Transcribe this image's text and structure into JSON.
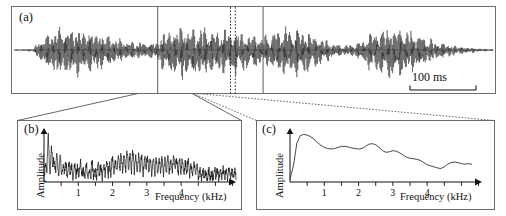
{
  "figure": {
    "panels": [
      {
        "id": "a",
        "label": "(a)",
        "type": "waveform",
        "scalebar": {
          "label": "100 ms"
        }
      },
      {
        "id": "b",
        "label": "(b)",
        "type": "spectrum",
        "ylabel": "Amplitude",
        "xlabel": "Frequency (kHz)",
        "ticks": [
          "1",
          "2",
          "3",
          "4"
        ]
      },
      {
        "id": "c",
        "label": "(c)",
        "type": "spectrum",
        "ylabel": "Amplitude",
        "xlabel": "Frequency (kHz)",
        "ticks": [
          "1",
          "2",
          "3",
          "4"
        ]
      }
    ]
  },
  "chart_data": [
    {
      "type": "line",
      "panel": "a",
      "title": "",
      "xlabel": "",
      "ylabel": "",
      "xlim": [
        0,
        1000
      ],
      "ylim": [
        -1,
        1
      ],
      "grid": false,
      "legend": null,
      "annotations": [
        {
          "text": "(a)",
          "x": 8,
          "y": 0.9
        },
        {
          "text": "100 ms",
          "x": 830,
          "y": -0.72
        }
      ],
      "scalebar_ms": 100,
      "description": "Amplitude-modulated acoustic waveform (oscillogram) with four successive tone bursts; vertical solid cursors at 300 and 520 ms and a narrow dotted cursor pair at 455-462 ms mark the analysis windows expanded in panels (b) and (c).",
      "markers": {
        "solid_lines_ms": [
          300,
          520
        ],
        "dotted_lines_ms": [
          452,
          462
        ]
      },
      "envelope": {
        "x": [
          0,
          20,
          40,
          55,
          70,
          85,
          100,
          115,
          130,
          145,
          160,
          175,
          190,
          205,
          220,
          235,
          250,
          265,
          280,
          295,
          300,
          310,
          325,
          340,
          355,
          370,
          385,
          400,
          415,
          430,
          445,
          455,
          462,
          470,
          485,
          500,
          515,
          520,
          530,
          545,
          560,
          575,
          590,
          605,
          620,
          635,
          650,
          665,
          680,
          695,
          710,
          725,
          740,
          755,
          770,
          785,
          800,
          815,
          830,
          845,
          860,
          875,
          890,
          905,
          920,
          935,
          950,
          965,
          980,
          1000
        ],
        "y": [
          0.02,
          0.03,
          0.05,
          0.35,
          0.62,
          0.74,
          0.8,
          0.82,
          0.8,
          0.76,
          0.7,
          0.64,
          0.56,
          0.47,
          0.4,
          0.34,
          0.3,
          0.28,
          0.27,
          0.28,
          0.3,
          0.62,
          0.78,
          0.84,
          0.86,
          0.85,
          0.83,
          0.8,
          0.78,
          0.76,
          0.74,
          0.72,
          0.7,
          0.68,
          0.64,
          0.58,
          0.5,
          0.48,
          0.56,
          0.7,
          0.8,
          0.84,
          0.82,
          0.76,
          0.66,
          0.52,
          0.38,
          0.26,
          0.2,
          0.18,
          0.22,
          0.36,
          0.56,
          0.74,
          0.84,
          0.88,
          0.86,
          0.8,
          0.7,
          0.58,
          0.46,
          0.36,
          0.28,
          0.22,
          0.17,
          0.13,
          0.1,
          0.07,
          0.05,
          0.03
        ]
      }
    },
    {
      "type": "line",
      "panel": "b",
      "title": "",
      "xlabel": "Frequency (kHz)",
      "ylabel": "Amplitude",
      "xlim": [
        0,
        5.6
      ],
      "ylim": [
        0,
        1
      ],
      "xticks": [
        0,
        0.5,
        1,
        1.5,
        2,
        2.5,
        3,
        3.5,
        4,
        4.5,
        5,
        5.5
      ],
      "xticklabels": [
        "",
        "",
        "1",
        "",
        "2",
        "",
        "3",
        "",
        "4",
        "",
        "",
        ""
      ],
      "grid": false,
      "legend": null,
      "description": "Noisy amplitude spectrum with a dense harmonic comb: very tall narrow peaks below 0.6 kHz, a broad secondary maximum near 2.3-2.6 kHz, and an abrupt drop in level above about 4.6 kHz.",
      "x": [
        0.0,
        0.06,
        0.12,
        0.18,
        0.24,
        0.3,
        0.36,
        0.42,
        0.48,
        0.54,
        0.6,
        0.68,
        0.76,
        0.84,
        0.92,
        1.0,
        1.08,
        1.16,
        1.24,
        1.32,
        1.4,
        1.5,
        1.6,
        1.7,
        1.8,
        1.9,
        2.0,
        2.1,
        2.2,
        2.3,
        2.4,
        2.5,
        2.6,
        2.7,
        2.8,
        2.9,
        3.0,
        3.1,
        3.2,
        3.3,
        3.4,
        3.5,
        3.6,
        3.7,
        3.8,
        3.9,
        4.0,
        4.1,
        4.2,
        4.3,
        4.4,
        4.5,
        4.6,
        4.7,
        4.8,
        4.9,
        5.0,
        5.1,
        5.2,
        5.3,
        5.4,
        5.5
      ],
      "y": [
        0.3,
        0.42,
        0.95,
        0.4,
        0.82,
        0.34,
        0.66,
        0.3,
        0.58,
        0.26,
        0.5,
        0.3,
        0.46,
        0.26,
        0.44,
        0.25,
        0.42,
        0.24,
        0.4,
        0.24,
        0.4,
        0.26,
        0.42,
        0.28,
        0.46,
        0.34,
        0.52,
        0.42,
        0.58,
        0.5,
        0.62,
        0.54,
        0.6,
        0.48,
        0.56,
        0.44,
        0.52,
        0.42,
        0.5,
        0.42,
        0.52,
        0.44,
        0.54,
        0.44,
        0.52,
        0.42,
        0.48,
        0.38,
        0.44,
        0.34,
        0.4,
        0.3,
        0.26,
        0.22,
        0.26,
        0.2,
        0.28,
        0.22,
        0.3,
        0.24,
        0.3,
        0.26
      ]
    },
    {
      "type": "line",
      "panel": "c",
      "title": "",
      "xlabel": "Frequency (kHz)",
      "ylabel": "Amplitude",
      "xlim": [
        0,
        5.6
      ],
      "ylim": [
        0,
        1
      ],
      "xticks": [
        0,
        0.5,
        1,
        1.5,
        2,
        2.5,
        3,
        3.5,
        4,
        4.5,
        5,
        5.5
      ],
      "xticklabels": [
        "",
        "",
        "1",
        "",
        "2",
        "",
        "3",
        "",
        "4",
        "",
        "",
        ""
      ],
      "grid": false,
      "legend": null,
      "description": "Smooth spectral envelope: steep rise to a maximum near 0.4 kHz, a gentle plateau between 1.5 and 3 kHz, then a progressive decline with small undulations above 3.5 kHz.",
      "x": [
        0.0,
        0.1,
        0.2,
        0.3,
        0.4,
        0.5,
        0.6,
        0.7,
        0.8,
        0.9,
        1.0,
        1.1,
        1.2,
        1.3,
        1.4,
        1.5,
        1.6,
        1.7,
        1.8,
        1.9,
        2.0,
        2.1,
        2.2,
        2.3,
        2.4,
        2.5,
        2.6,
        2.7,
        2.8,
        2.9,
        3.0,
        3.1,
        3.2,
        3.3,
        3.4,
        3.5,
        3.6,
        3.7,
        3.8,
        3.9,
        4.0,
        4.1,
        4.2,
        4.3,
        4.4,
        4.5,
        4.6,
        4.7,
        4.8,
        4.9,
        5.0,
        5.1,
        5.2,
        5.3
      ],
      "y": [
        0.05,
        0.3,
        0.72,
        0.86,
        0.88,
        0.87,
        0.84,
        0.79,
        0.73,
        0.68,
        0.64,
        0.62,
        0.61,
        0.62,
        0.64,
        0.66,
        0.66,
        0.65,
        0.63,
        0.62,
        0.61,
        0.62,
        0.66,
        0.7,
        0.71,
        0.69,
        0.64,
        0.58,
        0.55,
        0.56,
        0.58,
        0.57,
        0.54,
        0.5,
        0.46,
        0.44,
        0.43,
        0.42,
        0.4,
        0.36,
        0.32,
        0.3,
        0.28,
        0.26,
        0.25,
        0.28,
        0.33,
        0.36,
        0.37,
        0.36,
        0.34,
        0.33,
        0.34,
        0.33
      ]
    }
  ]
}
